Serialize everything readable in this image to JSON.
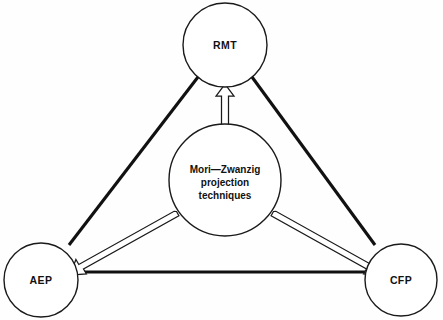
{
  "diagram": {
    "background_color": "#fefefe",
    "stroke_color": "#111111",
    "fill_color": "#ffffff",
    "nodes": [
      {
        "id": "rmt",
        "label": "RMT",
        "cx": 225,
        "cy": 45,
        "r": 42
      },
      {
        "id": "aep",
        "label": "AEP",
        "cx": 41,
        "cy": 280,
        "r": 37
      },
      {
        "id": "cfp",
        "label": "CFP",
        "cx": 401,
        "cy": 280,
        "r": 36
      }
    ],
    "center_node": {
      "id": "mori-zwanzig",
      "cx": 225,
      "cy": 180,
      "r": 56,
      "lines": [
        "Mori—Zwanzig",
        "projection",
        "techniques"
      ]
    },
    "edges": [
      {
        "id": "edge-rmt-aep",
        "from": "rmt",
        "to": "aep",
        "style": "thick-line"
      },
      {
        "id": "edge-rmt-cfp",
        "from": "rmt",
        "to": "cfp",
        "style": "thick-line"
      },
      {
        "id": "edge-aep-cfp",
        "from": "aep",
        "to": "cfp",
        "style": "thick-line"
      }
    ],
    "arrows": [
      {
        "id": "arrow-center-rmt",
        "from": "mori-zwanzig",
        "to": "rmt",
        "style": "hollow-outline"
      },
      {
        "id": "arrow-center-aep",
        "from": "mori-zwanzig",
        "to": "aep",
        "style": "hollow-outline"
      },
      {
        "id": "arrow-center-cfp",
        "from": "mori-zwanzig",
        "to": "cfp",
        "style": "hollow-outline"
      }
    ]
  }
}
